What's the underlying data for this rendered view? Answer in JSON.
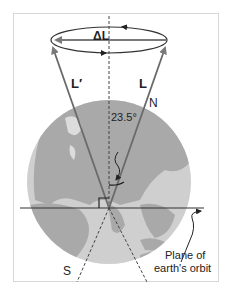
{
  "diagram": {
    "labels": {
      "delta_l": "ΔL",
      "l_prime": "L′",
      "l": "L",
      "north": "N",
      "south": "S",
      "angle": "23.5°",
      "orbit_line1": "Plane of",
      "orbit_line2": "earth's orbit"
    },
    "colors": {
      "frame": "#d8d8d8",
      "ocean": "#c8c8c8",
      "land": "#a8a8a8",
      "arrow": "#7a7a7a",
      "line": "#333333"
    }
  }
}
